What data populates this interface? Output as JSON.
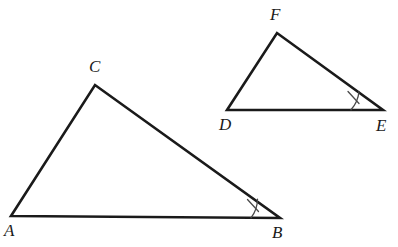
{
  "figure": {
    "background_color": "#ffffff",
    "stroke_color": "#1a1a1a",
    "mark_color": "#4a4a4a",
    "width": 398,
    "height": 247
  },
  "triangles": [
    {
      "id": "triangle-abc",
      "name": "ABC",
      "vertices": [
        {
          "label": "A",
          "x": 11,
          "y": 216,
          "label_x": 4,
          "label_y": 222
        },
        {
          "label": "B",
          "x": 280,
          "y": 218,
          "label_x": 272,
          "label_y": 224
        },
        {
          "label": "C",
          "x": 95,
          "y": 85,
          "label_x": 89,
          "label_y": 58
        }
      ],
      "path": "M 11 216 L 280 218 L 95 85 Z",
      "angle_mark": {
        "at_vertex": "B",
        "arc_path": "M 251 217.8 A 31 31 0 0 0 257.5 199.2",
        "tick_path": "M 247.5 199.5 L 258.5 211.5",
        "mark_type": "single-tick-arc"
      }
    },
    {
      "id": "triangle-def",
      "name": "DEF",
      "vertices": [
        {
          "label": "D",
          "x": 227,
          "y": 110,
          "label_x": 219,
          "label_y": 116
        },
        {
          "label": "E",
          "x": 383,
          "y": 110,
          "label_x": 376,
          "label_y": 117
        },
        {
          "label": "F",
          "x": 277,
          "y": 33,
          "label_x": 270,
          "label_y": 6
        }
      ],
      "path": "M 227 110 L 383 110 L 277 33 Z",
      "angle_mark": {
        "at_vertex": "E",
        "arc_path": "M 351 109.8 A 32 32 0 0 0 359 91.5",
        "tick_path": "M 348 91.5 L 359 103.5",
        "mark_type": "single-tick-arc"
      }
    }
  ],
  "labels": {
    "A": "A",
    "B": "B",
    "C": "C",
    "D": "D",
    "E": "E",
    "F": "F"
  }
}
